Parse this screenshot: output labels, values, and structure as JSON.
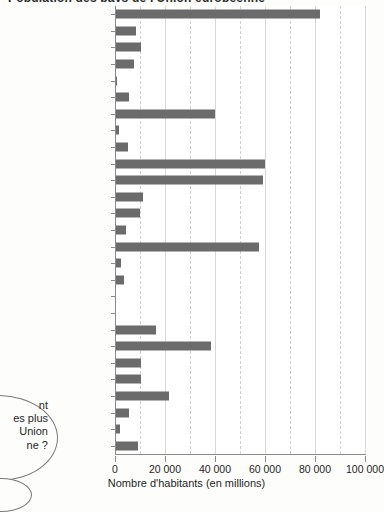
{
  "title_sliver": "Population des pays de l'Union européenne",
  "axis": {
    "xlabel": "Nombre d'habitants (en millions)",
    "xticks": [
      "0",
      "20 000",
      "40 000",
      "60 000",
      "80 000",
      "100 000"
    ],
    "xtick_values": [
      0,
      20000,
      40000,
      60000,
      80000,
      100000
    ],
    "minor_gridlines": [
      10000,
      30000,
      50000,
      70000,
      90000
    ],
    "xmin": 0,
    "xmax": 100000
  },
  "bubble": {
    "lines": "nt\nes plus\nUnion\nne ?",
    "note": "texte partiellement coupé au bord gauche"
  },
  "colors": {
    "bar": "#6b6b6b",
    "grid": "#d8d8d6",
    "axis": "#8a8a88",
    "plot_background": "#ffffff",
    "page_background": "#fdfdfb"
  },
  "chart_data": {
    "type": "bar",
    "orientation": "horizontal",
    "title": "Population des pays de l'Union européenne",
    "xlabel": "Nombre d'habitants (en millions)",
    "ylabel": "",
    "xlim": [
      0,
      100000
    ],
    "grid": true,
    "legend": "none",
    "categories": [
      "Allemagne",
      "Autriche",
      "Belgique",
      "Bulgarie",
      "Chypre",
      "Danemark",
      "Espagne",
      "Estonie",
      "Finlande",
      "France",
      "Grande-Bretagne",
      "Grèce",
      "Hongrie",
      "Irlande",
      "Italie",
      "Lettonie",
      "Lituanie",
      "Luxembourg",
      "Malte",
      "Pays-Bas",
      "Pologne",
      "Portugal",
      "République tchèque",
      "Roumanie",
      "Slovaquie",
      "Slovénie",
      "Suède"
    ],
    "values": [
      82000,
      8200,
      10400,
      7700,
      800,
      5400,
      40000,
      1400,
      5200,
      60000,
      59000,
      11000,
      10100,
      4200,
      57500,
      2300,
      3500,
      450,
      400,
      16200,
      38200,
      10500,
      10300,
      21500,
      5400,
      2000,
      9000
    ]
  }
}
